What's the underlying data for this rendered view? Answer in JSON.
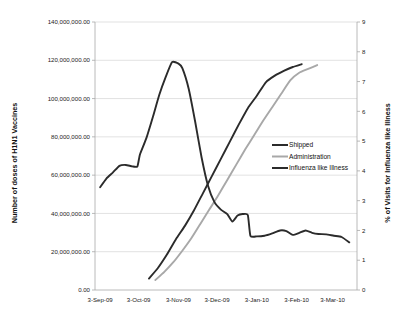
{
  "chart_data": {
    "type": "line",
    "title": "",
    "xlabel": "",
    "ylabel": "Number of doses of H1N1 Vaccines",
    "y2label": "% of Visits for Influenza like Illness",
    "grid": true,
    "legend_position": "center-right",
    "x_tick_labels": [
      "3-Sep-09",
      "3-Oct-09",
      "3-Nov-09",
      "3-Dec-09",
      "3-Jan-10",
      "3-Feb-10",
      "3-Mar-10"
    ],
    "x_tick_values": [
      0,
      30,
      61,
      91,
      122,
      153,
      181
    ],
    "xlim": [
      -4,
      200
    ],
    "ylim": [
      0,
      140000000
    ],
    "y_tick_labels": [
      "0.00",
      "20,000,000.00",
      "40,000,000.00",
      "60,000,000.00",
      "80,000,000.00",
      "100,000,000.00",
      "120,000,000.00",
      "140,000,000.00"
    ],
    "y_tick_values": [
      0,
      20000000,
      40000000,
      60000000,
      80000000,
      100000000,
      120000000,
      140000000
    ],
    "y2lim": [
      0,
      9
    ],
    "y2_tick_labels": [
      "0",
      "1",
      "2",
      "3",
      "4",
      "5",
      "6",
      "7",
      "8",
      "9"
    ],
    "y2_tick_values": [
      0,
      1,
      2,
      3,
      4,
      5,
      6,
      7,
      8,
      9
    ],
    "series": [
      {
        "name": "Shipped",
        "axis": "left",
        "color": "#2b2b2b",
        "width": 1.9,
        "points": [
          [
            38,
            6000000
          ],
          [
            45,
            11500000
          ],
          [
            52,
            18500000
          ],
          [
            59,
            26500000
          ],
          [
            66,
            33500000
          ],
          [
            73,
            41500000
          ],
          [
            80,
            50500000
          ],
          [
            87,
            59500000
          ],
          [
            94,
            68500000
          ],
          [
            101,
            77500000
          ],
          [
            108,
            86500000
          ],
          [
            115,
            95000000
          ],
          [
            122,
            101500000
          ],
          [
            129,
            108500000
          ],
          [
            136,
            112000000
          ],
          [
            143,
            114500000
          ],
          [
            150,
            116500000
          ],
          [
            157,
            118000000
          ]
        ]
      },
      {
        "name": "Administration",
        "axis": "left",
        "color": "#a8a8a8",
        "width": 1.9,
        "points": [
          [
            43,
            5200000
          ],
          [
            50,
            9500000
          ],
          [
            57,
            14500000
          ],
          [
            64,
            20500000
          ],
          [
            71,
            27000000
          ],
          [
            78,
            34500000
          ],
          [
            85,
            42000000
          ],
          [
            92,
            49500000
          ],
          [
            99,
            57500000
          ],
          [
            106,
            65500000
          ],
          [
            113,
            73500000
          ],
          [
            120,
            81000000
          ],
          [
            127,
            88500000
          ],
          [
            134,
            95500000
          ],
          [
            141,
            102500000
          ],
          [
            148,
            109500000
          ],
          [
            155,
            113500000
          ],
          [
            162,
            115500000
          ],
          [
            169,
            117500000
          ]
        ]
      },
      {
        "name": "Influenza like Illness",
        "axis": "right",
        "color": "#2b2b2b",
        "width": 1.9,
        "points": [
          [
            0,
            3.45
          ],
          [
            5,
            3.75
          ],
          [
            10,
            3.95
          ],
          [
            15,
            4.17
          ],
          [
            20,
            4.2
          ],
          [
            25,
            4.15
          ],
          [
            29,
            4.15
          ],
          [
            31,
            4.55
          ],
          [
            36,
            5.1
          ],
          [
            41,
            5.8
          ],
          [
            46,
            6.55
          ],
          [
            51,
            7.15
          ],
          [
            56,
            7.65
          ],
          [
            61,
            7.6
          ],
          [
            64,
            7.45
          ],
          [
            69,
            6.75
          ],
          [
            74,
            5.65
          ],
          [
            79,
            4.45
          ],
          [
            84,
            3.5
          ],
          [
            89,
            2.95
          ],
          [
            94,
            2.7
          ],
          [
            99,
            2.55
          ],
          [
            103,
            2.3
          ],
          [
            107,
            2.5
          ],
          [
            111,
            2.55
          ],
          [
            115,
            2.52
          ],
          [
            117,
            1.82
          ],
          [
            122,
            1.8
          ],
          [
            128,
            1.82
          ],
          [
            134,
            1.9
          ],
          [
            140,
            2.0
          ],
          [
            145,
            1.98
          ],
          [
            150,
            1.85
          ],
          [
            155,
            1.92
          ],
          [
            160,
            2.0
          ],
          [
            165,
            1.92
          ],
          [
            170,
            1.88
          ],
          [
            176,
            1.87
          ],
          [
            182,
            1.82
          ],
          [
            188,
            1.78
          ],
          [
            194,
            1.6
          ]
        ]
      }
    ],
    "legend_entries": [
      {
        "label": "Shipped",
        "color": "#2b2b2b"
      },
      {
        "label": "Administration",
        "color": "#a8a8a8"
      },
      {
        "label": "Influenza like Illness",
        "color": "#2b2b2b"
      }
    ]
  }
}
